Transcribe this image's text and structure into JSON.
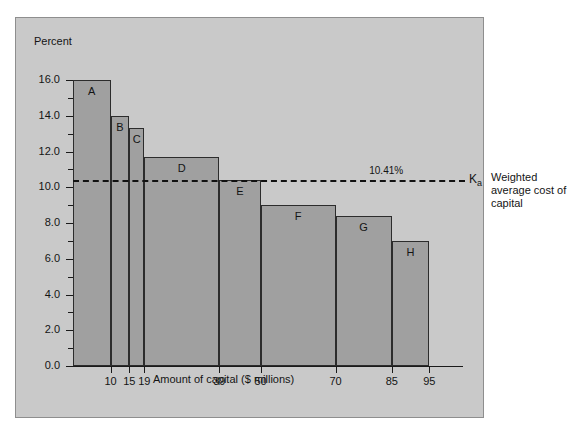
{
  "chart_data": {
    "type": "bar",
    "title": "",
    "xlabel": "Amount of capital ($ millions)",
    "ylabel": "Percent",
    "ylim": [
      0.0,
      16.0
    ],
    "xlim": [
      0,
      100
    ],
    "grid": false,
    "legend": "none",
    "y_ticks": [
      "0.0",
      "2.0",
      "4.0",
      "6.0",
      "8.0",
      "10.0",
      "12.0",
      "14.0",
      "16.0"
    ],
    "y_tick_values": [
      0.0,
      2.0,
      4.0,
      6.0,
      8.0,
      10.0,
      12.0,
      14.0,
      16.0
    ],
    "y_minor_tick_values": [
      1.0,
      3.0,
      5.0,
      7.0,
      9.0,
      11.0,
      13.0,
      15.0
    ],
    "x_ticks": [
      "10",
      "15",
      "19",
      "39",
      "50",
      "70",
      "85",
      "95"
    ],
    "x_tick_values": [
      10,
      15,
      19,
      39,
      50,
      70,
      85,
      95
    ],
    "bar_edges": [
      0,
      10,
      15,
      19,
      39,
      50,
      70,
      85,
      95
    ],
    "bars": [
      {
        "label": "A",
        "x_start": 0,
        "x_end": 10,
        "value": 16.0
      },
      {
        "label": "B",
        "x_start": 10,
        "x_end": 15,
        "value": 14.0
      },
      {
        "label": "C",
        "x_start": 15,
        "x_end": 19,
        "value": 13.3
      },
      {
        "label": "D",
        "x_start": 19,
        "x_end": 39,
        "value": 11.7
      },
      {
        "label": "E",
        "x_start": 39,
        "x_end": 50,
        "value": 10.4
      },
      {
        "label": "F",
        "x_start": 50,
        "x_end": 70,
        "value": 9.0
      },
      {
        "label": "G",
        "x_start": 70,
        "x_end": 85,
        "value": 8.4
      },
      {
        "label": "H",
        "x_start": 85,
        "x_end": 95,
        "value": 7.0
      }
    ],
    "annotations": [
      {
        "name": "weighted-average-cost-of-capital-line",
        "style": "dashed-horizontal",
        "value": 10.41,
        "value_label": "10.41%",
        "symbol": "K",
        "symbol_subscript": "a",
        "caption": "Weighted average cost of capital"
      }
    ]
  },
  "colors": {
    "panel_background": "#c9c9c9",
    "bar_fill": "#a0a0a0",
    "bar_edge": "#2c2c2c",
    "axis": "#1a1a1a",
    "text": "#141414",
    "wacc_line": "#111111"
  }
}
